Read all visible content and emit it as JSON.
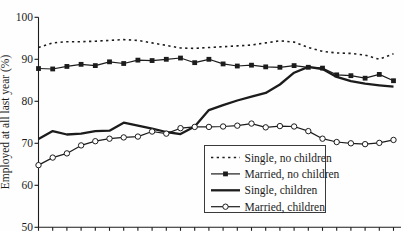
{
  "chart_data": {
    "type": "line",
    "title": "",
    "ylabel": "Employed at all last year (%)",
    "xlabel": "",
    "ylim": [
      50,
      100
    ],
    "yticks": [
      50,
      60,
      70,
      80,
      90,
      100
    ],
    "x_point_count": 26,
    "x_axis_labels_visible": false,
    "grid": false,
    "legend_position": "inside-bottom-right",
    "line_color": "#1c1c1c",
    "background_color": "#fefefe",
    "series": [
      {
        "name": "Single, no children",
        "style": "dotted",
        "marker": "none",
        "values": [
          92.8,
          93.9,
          94.2,
          94.2,
          94.3,
          94.5,
          94.7,
          94.5,
          93.9,
          93.3,
          92.7,
          92.6,
          92.8,
          93.0,
          93.2,
          93.4,
          93.9,
          94.4,
          94.1,
          92.8,
          91.9,
          91.5,
          91.4,
          91.0,
          90.0,
          91.3
        ]
      },
      {
        "name": "Married, no children",
        "style": "solid-thin",
        "marker": "filled-square",
        "values": [
          87.8,
          87.7,
          88.3,
          88.8,
          88.5,
          89.4,
          89.0,
          89.8,
          89.7,
          90.0,
          90.3,
          89.2,
          90.0,
          88.9,
          88.4,
          88.6,
          88.2,
          88.1,
          88.5,
          88.1,
          87.9,
          86.3,
          86.1,
          85.5,
          86.4,
          84.9
        ]
      },
      {
        "name": "Single, children",
        "style": "solid-thick",
        "marker": "none",
        "values": [
          71.0,
          72.9,
          72.1,
          72.3,
          72.9,
          73.0,
          74.9,
          74.2,
          73.5,
          72.7,
          72.2,
          74.0,
          77.9,
          79.1,
          80.2,
          81.1,
          82.0,
          84.0,
          86.8,
          88.2,
          87.7,
          85.8,
          84.8,
          84.2,
          83.8,
          83.5
        ]
      },
      {
        "name": "Married, children",
        "style": "solid-thin",
        "marker": "open-circle",
        "values": [
          64.8,
          66.6,
          67.6,
          69.5,
          70.5,
          71.1,
          71.4,
          71.6,
          72.8,
          72.3,
          73.6,
          73.9,
          73.9,
          74.0,
          74.2,
          74.7,
          73.8,
          74.1,
          74.0,
          72.9,
          71.1,
          70.3,
          70.0,
          69.8,
          70.1,
          70.8
        ]
      }
    ]
  }
}
